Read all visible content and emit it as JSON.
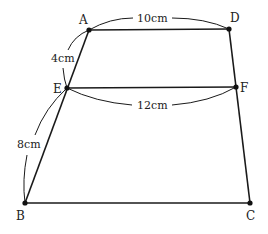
{
  "figure": {
    "type": "trapezoid-with-midsegment",
    "points": {
      "A": {
        "label": "A",
        "x": 89,
        "y": 30
      },
      "D": {
        "label": "D",
        "x": 229,
        "y": 29
      },
      "E": {
        "label": "E",
        "x": 67,
        "y": 88
      },
      "F": {
        "label": "F",
        "x": 236,
        "y": 87
      },
      "B": {
        "label": "B",
        "x": 25,
        "y": 203
      },
      "C": {
        "label": "C",
        "x": 250,
        "y": 203
      }
    },
    "measurements": {
      "AD": "10cm",
      "AE": "4cm",
      "EF": "12cm",
      "EB": "8cm"
    }
  }
}
